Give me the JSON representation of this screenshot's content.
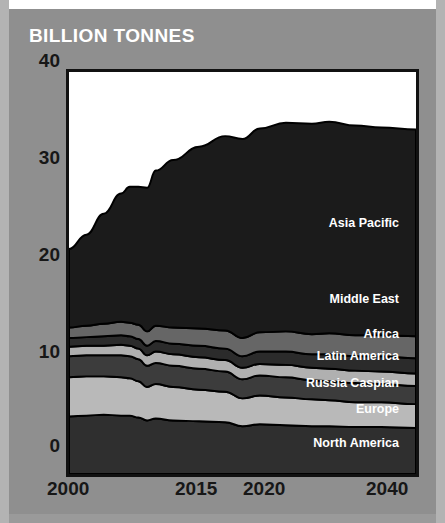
{
  "header": {
    "title": "BILLION TONNES"
  },
  "colors": {
    "background": "#8f8f8f",
    "edge_strip": "#b3b3b3",
    "plot_background": "#ffffff",
    "plot_border": "#111111",
    "axis_text": "#171717",
    "title_text": "#ffffff",
    "label_text": "#ffffff"
  },
  "chart_data": {
    "type": "area",
    "stacked": true,
    "title": "BILLION TONNES",
    "xlabel": "",
    "ylabel": "",
    "xlim": [
      2000,
      2040
    ],
    "ylim": [
      0,
      42
    ],
    "grid": false,
    "legend_position": "inline-right",
    "ytick_labels": [
      "40",
      "30",
      "20",
      "10",
      "0"
    ],
    "ytick_values": [
      40,
      30,
      20,
      10,
      0
    ],
    "xtick_labels": [
      "2000",
      "2015",
      "2020",
      "2040"
    ],
    "xtick_values": [
      2000,
      2015,
      2020,
      2040
    ],
    "x": [
      2000,
      2002,
      2004,
      2006,
      2007,
      2008,
      2009,
      2010,
      2012,
      2015,
      2018,
      2020,
      2022,
      2025,
      2028,
      2030,
      2033,
      2036,
      2040
    ],
    "series": [
      {
        "name": "North America",
        "label": "North America",
        "color": "#2f2f2f",
        "label_color": "#ffffff",
        "values": [
          6.0,
          6.1,
          6.2,
          6.1,
          6.1,
          5.9,
          5.6,
          5.8,
          5.6,
          5.5,
          5.4,
          5.0,
          5.2,
          5.1,
          5.0,
          5.0,
          4.9,
          4.9,
          4.8
        ]
      },
      {
        "name": "Europe",
        "label": "Europe",
        "color": "#b9b9b9",
        "label_color": "#ffffff",
        "values": [
          4.1,
          4.1,
          4.0,
          4.0,
          3.9,
          3.8,
          3.5,
          3.6,
          3.5,
          3.3,
          3.2,
          2.9,
          3.0,
          2.9,
          2.8,
          2.7,
          2.6,
          2.6,
          2.5
        ]
      },
      {
        "name": "Russia Caspian",
        "label": "Russia Caspian",
        "color": "#3c3c3c",
        "label_color": "#ffffff",
        "values": [
          2.2,
          2.2,
          2.2,
          2.3,
          2.3,
          2.3,
          2.2,
          2.2,
          2.2,
          2.2,
          2.1,
          2.0,
          2.1,
          2.1,
          2.0,
          2.0,
          2.0,
          1.9,
          1.9
        ]
      },
      {
        "name": "Latin America",
        "label": "Latin America",
        "color": "#b0b0b0",
        "label_color": "#ffffff",
        "values": [
          1.0,
          1.0,
          1.0,
          1.1,
          1.1,
          1.1,
          1.1,
          1.2,
          1.2,
          1.2,
          1.2,
          1.2,
          1.2,
          1.3,
          1.3,
          1.3,
          1.3,
          1.3,
          1.3
        ]
      },
      {
        "name": "Africa",
        "label": "Africa",
        "color": "#2b2b2b",
        "label_color": "#ffffff",
        "values": [
          0.9,
          0.9,
          1.0,
          1.0,
          1.0,
          1.0,
          1.0,
          1.1,
          1.1,
          1.2,
          1.2,
          1.2,
          1.3,
          1.4,
          1.4,
          1.5,
          1.5,
          1.6,
          1.6
        ]
      },
      {
        "name": "Middle East",
        "label": "Middle East",
        "color": "#666666",
        "label_color": "#ffffff",
        "values": [
          1.1,
          1.2,
          1.3,
          1.4,
          1.4,
          1.5,
          1.5,
          1.6,
          1.7,
          1.8,
          1.9,
          1.9,
          2.0,
          2.1,
          2.1,
          2.2,
          2.2,
          2.2,
          2.3
        ]
      },
      {
        "name": "Asia Pacific",
        "label": "Asia Pacific",
        "color": "#1b1b1b",
        "label_color": "#ffffff",
        "values": [
          8.2,
          9.5,
          11.5,
          13.4,
          14.2,
          14.4,
          15.0,
          16.2,
          17.5,
          19.0,
          20.3,
          20.8,
          21.3,
          21.8,
          22.0,
          22.1,
          21.9,
          21.7,
          21.6
        ]
      }
    ],
    "totals": [
      23.5,
      25.0,
      27.2,
      29.3,
      30.0,
      30.0,
      29.9,
      31.7,
      32.8,
      34.2,
      35.3,
      35.0,
      36.1,
      36.7,
      36.6,
      36.8,
      36.4,
      36.2,
      36.0
    ]
  },
  "labels": {
    "asia_pacific": "Asia Pacific",
    "middle_east": "Middle East",
    "africa": "Africa",
    "latin_america": "Latin America",
    "russia_caspian": "Russia Caspian",
    "europe": "Europe",
    "north_america": "North America"
  }
}
